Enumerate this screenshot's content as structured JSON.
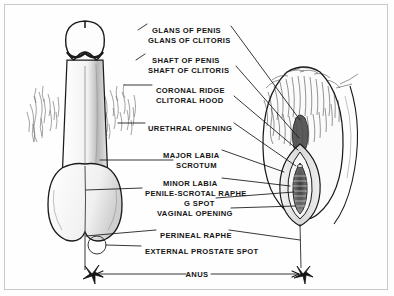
{
  "diagram": {
    "kind": "anatomical-comparison-line-drawing",
    "background_color": "#fefefe",
    "ink_color": "#141414",
    "frame_color": "#c9c9c9",
    "figures": [
      {
        "id": "left-figure",
        "name": "male-external-genitalia",
        "side": "left"
      },
      {
        "id": "right-figure",
        "name": "female-external-genitalia",
        "side": "right"
      }
    ],
    "labels": [
      {
        "id": "glans-of-penis",
        "text": "GLANS OF PENIS",
        "x": 152,
        "y": 26,
        "align": "left"
      },
      {
        "id": "glans-of-clitoris",
        "text": "GLANS OF CLITORIS",
        "x": 148,
        "y": 36,
        "align": "left"
      },
      {
        "id": "shaft-of-penis",
        "text": "SHAFT OF PENIS",
        "x": 152,
        "y": 56,
        "align": "left"
      },
      {
        "id": "shaft-of-clitoris",
        "text": "SHAFT OF CLITORIS",
        "x": 148,
        "y": 66,
        "align": "left"
      },
      {
        "id": "coronal-ridge",
        "text": "CORONAL RIDGE",
        "x": 156,
        "y": 86,
        "align": "left"
      },
      {
        "id": "clitoral-hood",
        "text": "CLITORAL HOOD",
        "x": 156,
        "y": 96,
        "align": "left"
      },
      {
        "id": "urethral-opening",
        "text": "URETHRAL OPENING",
        "x": 148,
        "y": 124,
        "align": "left"
      },
      {
        "id": "major-labia",
        "text": "MAJOR LABIA",
        "x": 163,
        "y": 151,
        "align": "left"
      },
      {
        "id": "scrotum",
        "text": "SCROTUM",
        "x": 176,
        "y": 161,
        "align": "left"
      },
      {
        "id": "minor-labia",
        "text": "MINOR LABIA",
        "x": 163,
        "y": 179,
        "align": "left"
      },
      {
        "id": "penile-scrotal-raphe",
        "text": "PENILE-SCROTAL RAPHE",
        "x": 145,
        "y": 189,
        "align": "left"
      },
      {
        "id": "g-spot",
        "text": "G SPOT",
        "x": 184,
        "y": 199,
        "align": "left"
      },
      {
        "id": "vaginal-opening",
        "text": "VAGINAL OPENING",
        "x": 157,
        "y": 209,
        "align": "left"
      },
      {
        "id": "perineal-raphe",
        "text": "PERINEAL RAPHE",
        "x": 160,
        "y": 231,
        "align": "left"
      },
      {
        "id": "external-prostate-spot",
        "text": "EXTERNAL PROSTATE SPOT",
        "x": 145,
        "y": 247,
        "align": "left"
      },
      {
        "id": "anus",
        "text": "ANUS",
        "x": 197,
        "y": 272,
        "align": "center"
      }
    ],
    "markers": [
      {
        "id": "external-prostate-spot-marker",
        "shape": "circle",
        "x": 97,
        "y": 245,
        "r": 9
      },
      {
        "id": "anus-marker-left",
        "shape": "starburst",
        "x": 92,
        "y": 274
      },
      {
        "id": "anus-marker-right",
        "shape": "starburst",
        "x": 303,
        "y": 274
      }
    ],
    "anus_measure_line": {
      "from_x": 96,
      "to_x": 299,
      "y": 274,
      "double_headed": true
    }
  }
}
